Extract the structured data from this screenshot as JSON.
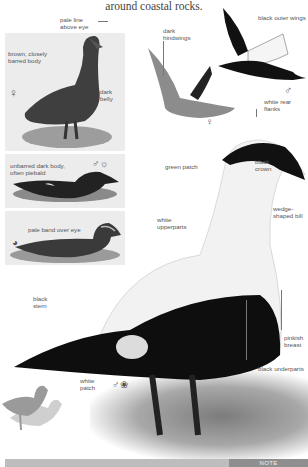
{
  "intro_text": "around coastal rocks.",
  "female_standing": {
    "labels": {
      "eye": "pale line above eye",
      "body": "brown, closely barred body",
      "belly": "dark belly"
    },
    "sex_symbol": "♀"
  },
  "male_eclipse_swimming": {
    "label": "unbarred dark body, often piebald",
    "symbol": "♂☼"
  },
  "juvenile_swimming": {
    "label": "pale band over eye",
    "symbol": "◕"
  },
  "female_flight": {
    "label": "dark hindwings",
    "sex_symbol": "♀"
  },
  "male_flight": {
    "labels": {
      "wings": "black outer wings",
      "flanks": "white rear flanks"
    },
    "sex_symbol": "♂"
  },
  "male_main": {
    "labels": {
      "crown": "black crown",
      "green_patch": "green patch",
      "bill": "wedge-shaped bill",
      "upperparts": "white upperparts",
      "stern": "black stern",
      "breast": "pinkish breast",
      "underparts": "black underparts",
      "patch": "white patch"
    },
    "symbol": "♂❀"
  },
  "footer": {
    "note_label": "NOTE"
  },
  "colors": {
    "background": "#ffffff",
    "panel": "#ececec",
    "footer_bar": "#bdbdbd",
    "note_tab": "#8f8f8f",
    "silhouette_dark": "#9a9a9a",
    "silhouette_light": "#cfcfcf"
  }
}
